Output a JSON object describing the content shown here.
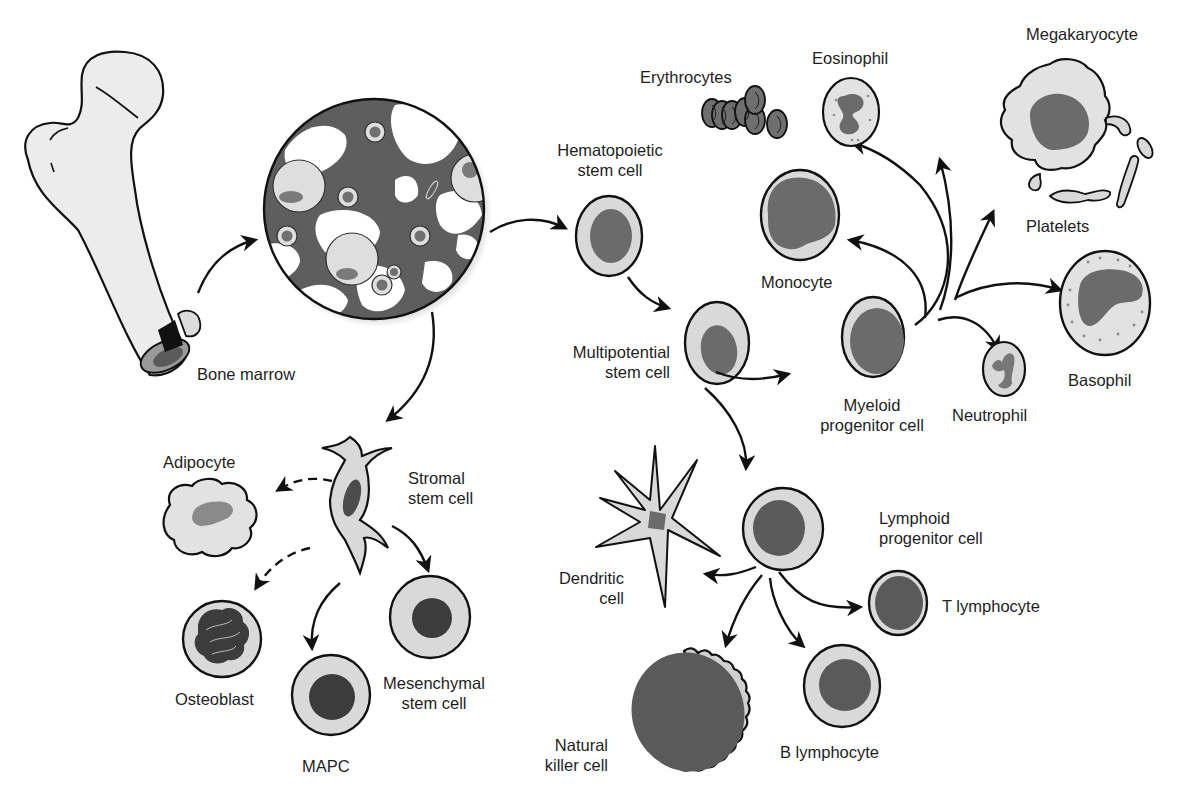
{
  "diagram": {
    "type": "cell-lineage",
    "colors": {
      "outline": "#111111",
      "cytoplasm": "#d9d9d9",
      "nucleus": "#6b6b6b",
      "dark_nucleus": "#3f3f3f",
      "marrow_matrix": "#5e5e5e",
      "background": "#ffffff"
    },
    "labels": {
      "bone_marrow": "Bone marrow",
      "hsc": [
        "Hematopoietic",
        "stem cell"
      ],
      "mpsc": [
        "Multipotential",
        "stem cell"
      ],
      "myeloid": [
        "Myeloid",
        "progenitor cell"
      ],
      "lymphoid": [
        "Lymphoid",
        "progenitor cell"
      ],
      "erythrocytes": "Erythrocytes",
      "eosinophil": "Eosinophil",
      "megakaryocyte": "Megakaryocyte",
      "platelets": "Platelets",
      "monocyte": "Monocyte",
      "basophil": "Basophil",
      "neutrophil": "Neutrophil",
      "dendritic": [
        "Dendritic",
        "cell"
      ],
      "t_lymphocyte": "T lymphocyte",
      "b_lymphocyte": "B lymphocyte",
      "nk": [
        "Natural",
        "killer cell"
      ],
      "adipocyte": "Adipocyte",
      "stromal": [
        "Stromal",
        "stem cell"
      ],
      "osteoblast": "Osteoblast",
      "mapc": "MAPC",
      "mesenchymal": [
        "Mesenchymal",
        "stem cell"
      ]
    },
    "edges": [
      {
        "from": "Bone",
        "to": "Bone marrow",
        "style": "solid"
      },
      {
        "from": "Bone marrow",
        "to": "Hematopoietic stem cell",
        "style": "solid"
      },
      {
        "from": "Bone marrow",
        "to": "Stromal stem cell",
        "style": "solid"
      },
      {
        "from": "Hematopoietic stem cell",
        "to": "Multipotential stem cell",
        "style": "solid"
      },
      {
        "from": "Multipotential stem cell",
        "to": "Myeloid progenitor cell",
        "style": "solid"
      },
      {
        "from": "Multipotential stem cell",
        "to": "Lymphoid progenitor cell",
        "style": "solid"
      },
      {
        "from": "Myeloid progenitor cell",
        "to": "Erythrocytes",
        "style": "solid"
      },
      {
        "from": "Myeloid progenitor cell",
        "to": "Eosinophil",
        "style": "solid"
      },
      {
        "from": "Myeloid progenitor cell",
        "to": "Megakaryocyte",
        "style": "solid"
      },
      {
        "from": "Myeloid progenitor cell",
        "to": "Monocyte",
        "style": "solid"
      },
      {
        "from": "Myeloid progenitor cell",
        "to": "Basophil",
        "style": "solid"
      },
      {
        "from": "Myeloid progenitor cell",
        "to": "Neutrophil",
        "style": "solid"
      },
      {
        "from": "Lymphoid progenitor cell",
        "to": "Dendritic cell",
        "style": "solid"
      },
      {
        "from": "Lymphoid progenitor cell",
        "to": "T lymphocyte",
        "style": "solid"
      },
      {
        "from": "Lymphoid progenitor cell",
        "to": "B lymphocyte",
        "style": "solid"
      },
      {
        "from": "Lymphoid progenitor cell",
        "to": "Natural killer cell",
        "style": "solid"
      },
      {
        "from": "Stromal stem cell",
        "to": "Adipocyte",
        "style": "dashed"
      },
      {
        "from": "Stromal stem cell",
        "to": "Osteoblast",
        "style": "dashed"
      },
      {
        "from": "Stromal stem cell",
        "to": "MAPC",
        "style": "solid"
      },
      {
        "from": "Stromal stem cell",
        "to": "Mesenchymal stem cell",
        "style": "solid"
      }
    ]
  }
}
